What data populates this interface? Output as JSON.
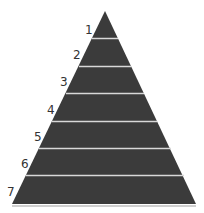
{
  "diagram": {
    "type": "pyramid",
    "levels": [
      {
        "label": "1"
      },
      {
        "label": "2"
      },
      {
        "label": "3"
      },
      {
        "label": "4"
      },
      {
        "label": "5"
      },
      {
        "label": "6"
      },
      {
        "label": "7"
      }
    ],
    "colors": {
      "fill": "#3a3a3a",
      "separator": "#d8d8d8",
      "label": "#333333"
    }
  }
}
